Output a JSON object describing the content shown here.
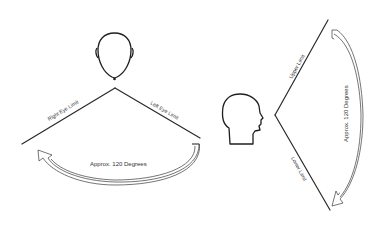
{
  "diagram": {
    "left_panel": {
      "view": "top-view head",
      "left_line_label": "Right Eye Limit",
      "right_line_label": "Left Eye Limit",
      "arc_label": "Approx. 120 Degrees"
    },
    "right_panel": {
      "view": "side-view head profile",
      "upper_line_label": "Upper Limit",
      "lower_line_label": "Lower Limit",
      "arc_label": "Approx. 120 Degrees"
    },
    "colors": {
      "line": "#2a2a2a",
      "text": "#333333",
      "background": "#ffffff"
    }
  }
}
